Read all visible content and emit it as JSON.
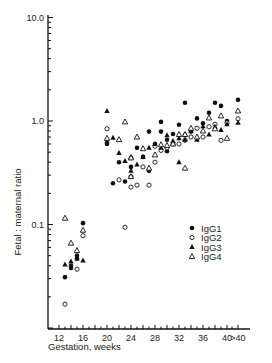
{
  "chart_data": {
    "type": "scatter",
    "title": "",
    "xlabel": "Gestation, weeks",
    "ylabel": "Fetal : maternal ratio",
    "x_tick_labels": [
      "12",
      "16",
      "20",
      "24",
      "28",
      "32",
      "36",
      "40",
      ">40"
    ],
    "x_ticks": [
      12,
      16,
      20,
      24,
      28,
      32,
      36,
      40,
      42
    ],
    "y_scale": "log",
    "y_tick_labels": [
      "10.0",
      "1.0",
      "0.1"
    ],
    "y_ticks": [
      10,
      1,
      0.1
    ],
    "ylim": [
      0.01,
      10
    ],
    "xlim": [
      10.5,
      43.5
    ],
    "grid": false,
    "legend_position": "lower right inside",
    "series": [
      {
        "name": "IgG1",
        "marker": "filled-circle",
        "points": [
          [
            13,
            0.031
          ],
          [
            14,
            0.038
          ],
          [
            14,
            0.04
          ],
          [
            15,
            0.047
          ],
          [
            15,
            0.05
          ],
          [
            16,
            0.103
          ],
          [
            20,
            0.62
          ],
          [
            20,
            0.6
          ],
          [
            21,
            0.25
          ],
          [
            22,
            0.4
          ],
          [
            23,
            0.26
          ],
          [
            24,
            0.44
          ],
          [
            24,
            0.36
          ],
          [
            25,
            0.55
          ],
          [
            26,
            0.45
          ],
          [
            27,
            0.33
          ],
          [
            27,
            0.79
          ],
          [
            28,
            0.6
          ],
          [
            29,
            0.98
          ],
          [
            29,
            0.79
          ],
          [
            30,
            0.66
          ],
          [
            30,
            0.51
          ],
          [
            31,
            0.75
          ],
          [
            32,
            0.92
          ],
          [
            33,
            0.73
          ],
          [
            33,
            1.5
          ],
          [
            34,
            0.79
          ],
          [
            35,
            1.06
          ],
          [
            36,
            0.95
          ],
          [
            37,
            1.2
          ],
          [
            38,
            1.5
          ],
          [
            39,
            1.4
          ],
          [
            40,
            1.0
          ],
          [
            42,
            1.6
          ]
        ]
      },
      {
        "name": "IgG2",
        "marker": "open-circle",
        "points": [
          [
            13,
            0.017
          ],
          [
            15,
            0.037
          ],
          [
            16,
            0.078
          ],
          [
            20,
            0.84
          ],
          [
            22,
            0.27
          ],
          [
            23,
            0.094
          ],
          [
            24,
            0.23
          ],
          [
            24,
            0.29
          ],
          [
            25,
            0.24
          ],
          [
            26,
            0.36
          ],
          [
            27,
            0.24
          ],
          [
            28,
            0.4
          ],
          [
            28,
            0.57
          ],
          [
            29,
            0.52
          ],
          [
            30,
            0.55
          ],
          [
            31,
            0.6
          ],
          [
            32,
            0.6
          ],
          [
            33,
            0.65
          ],
          [
            34,
            0.7
          ],
          [
            35,
            0.85
          ],
          [
            36,
            0.7
          ],
          [
            37,
            0.88
          ],
          [
            38,
            0.93
          ],
          [
            39,
            0.65
          ],
          [
            40,
            0.96
          ],
          [
            42,
            1.05
          ]
        ]
      },
      {
        "name": "IgG3",
        "marker": "filled-triangle",
        "points": [
          [
            13,
            0.041
          ],
          [
            14,
            0.044
          ],
          [
            15,
            0.047
          ],
          [
            16,
            0.045
          ],
          [
            20,
            1.25
          ],
          [
            21,
            0.69
          ],
          [
            22,
            0.49
          ],
          [
            23,
            0.41
          ],
          [
            24,
            0.33
          ],
          [
            24,
            0.45
          ],
          [
            25,
            0.38
          ],
          [
            26,
            0.45
          ],
          [
            27,
            0.55
          ],
          [
            28,
            0.6
          ],
          [
            29,
            0.55
          ],
          [
            30,
            0.73
          ],
          [
            31,
            0.64
          ],
          [
            32,
            0.68
          ],
          [
            32,
            0.4
          ],
          [
            33,
            0.66
          ],
          [
            34,
            0.8
          ],
          [
            35,
            0.66
          ],
          [
            36,
            0.89
          ],
          [
            37,
            0.74
          ],
          [
            38,
            0.88
          ],
          [
            39,
            0.82
          ],
          [
            40,
            0.93
          ],
          [
            42,
            0.96
          ]
        ]
      },
      {
        "name": "IgG4",
        "marker": "open-triangle",
        "points": [
          [
            13,
            0.115
          ],
          [
            14,
            0.066
          ],
          [
            15,
            0.056
          ],
          [
            16,
            0.088
          ],
          [
            20,
            0.68
          ],
          [
            22,
            0.66
          ],
          [
            23,
            0.98
          ],
          [
            24,
            0.29
          ],
          [
            24,
            0.44
          ],
          [
            25,
            0.7
          ],
          [
            26,
            0.54
          ],
          [
            27,
            0.35
          ],
          [
            28,
            0.47
          ],
          [
            29,
            0.59
          ],
          [
            30,
            0.58
          ],
          [
            31,
            0.6
          ],
          [
            32,
            0.74
          ],
          [
            33,
            0.74
          ],
          [
            33,
            0.35
          ],
          [
            34,
            0.85
          ],
          [
            35,
            0.7
          ],
          [
            36,
            0.8
          ],
          [
            37,
            1.07
          ],
          [
            38,
            0.84
          ],
          [
            39,
            1.12
          ],
          [
            40,
            0.68
          ],
          [
            42,
            1.25
          ]
        ]
      }
    ],
    "legend": [
      {
        "label": "IgG1",
        "marker": "filled-circle"
      },
      {
        "label": "IgG2",
        "marker": "open-circle"
      },
      {
        "label": "IgG3",
        "marker": "filled-triangle"
      },
      {
        "label": "IgG4",
        "marker": "open-triangle"
      }
    ]
  }
}
